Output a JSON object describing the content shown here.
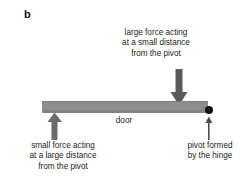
{
  "figure": {
    "panel_label": "b",
    "background_color": "#ffffff",
    "text_color": "#1d1d1d"
  },
  "door": {
    "label": "door",
    "fill_color": "#8d8d8d",
    "edge_color": "#7e7e7e"
  },
  "pivot": {
    "dot_color": "#111111",
    "caption_lines": [
      "pivot formed",
      "by the hinge"
    ],
    "pointer_color": "#4f4f4f"
  },
  "large_force": {
    "caption_lines": [
      "large force acting",
      "at a small distance",
      "from the pivot"
    ],
    "arrow_direction": "down",
    "arrow_color": "#5a5a5a"
  },
  "small_force": {
    "caption_lines": [
      "small force acting",
      "at a large distance",
      "from the pivot"
    ],
    "arrow_direction": "up",
    "arrow_color": "#6b6b6b"
  }
}
